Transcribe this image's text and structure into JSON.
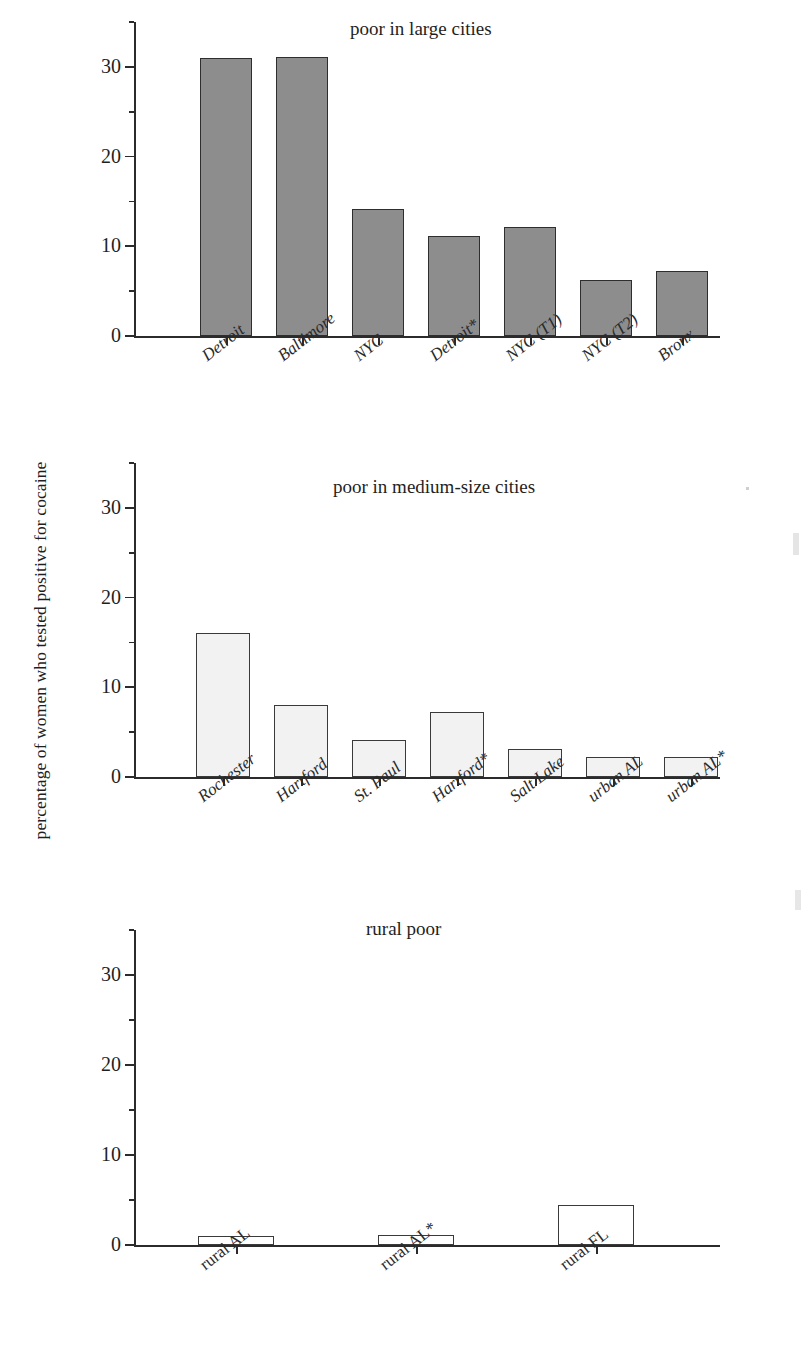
{
  "figure": {
    "ylabel": "percentage of women who tested positive for cocaine",
    "y_ticks": [
      "0",
      "10",
      "20",
      "30"
    ]
  },
  "chart_data": [
    {
      "type": "bar",
      "title": "poor in large cities",
      "xlabel": "",
      "ylabel": "percentage of women who tested positive for cocaine",
      "ylim": [
        0,
        35
      ],
      "yticks": [
        0,
        10,
        20,
        30
      ],
      "grid": false,
      "legend": "none",
      "bar_style": "gray-filled",
      "categories": [
        "Detroit",
        "Baltimore",
        "NYC",
        "Detroit*",
        "NYC (T1)",
        "NYC (T2)",
        "Bronx"
      ],
      "values": [
        31.0,
        31.1,
        14.2,
        11.2,
        12.2,
        6.2,
        7.3
      ]
    },
    {
      "type": "bar",
      "title": "poor in medium-size cities",
      "xlabel": "",
      "ylabel": "percentage of women who tested positive for cocaine",
      "ylim": [
        0,
        35
      ],
      "yticks": [
        0,
        10,
        20,
        30
      ],
      "grid": false,
      "legend": "none",
      "bar_style": "light-filled",
      "categories": [
        "Rochester",
        "Hartford",
        "St. Paul",
        "Hartford*",
        "Salt Lake",
        "urban AL",
        "urban AL*"
      ],
      "values": [
        16.0,
        8.0,
        4.1,
        7.2,
        3.1,
        2.2,
        2.2
      ]
    },
    {
      "type": "bar",
      "title": "rural poor",
      "xlabel": "",
      "ylabel": "percentage of women who tested positive for cocaine",
      "ylim": [
        0,
        35
      ],
      "yticks": [
        0,
        10,
        20,
        30
      ],
      "grid": false,
      "legend": "none",
      "bar_style": "open",
      "categories": [
        "rural AL",
        "rural AL*",
        "rural FL"
      ],
      "values": [
        1.0,
        1.1,
        4.4
      ]
    }
  ]
}
